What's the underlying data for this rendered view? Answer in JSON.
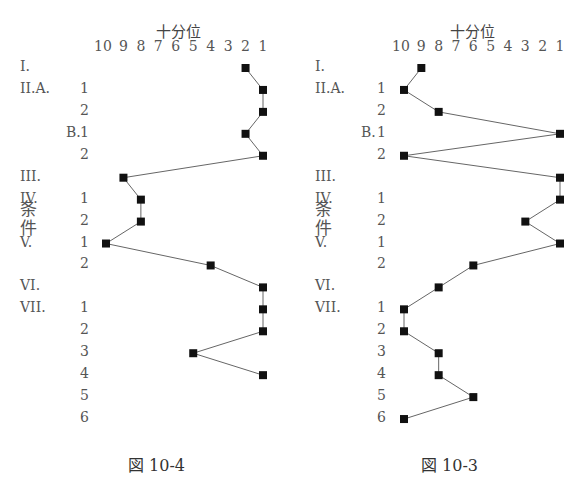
{
  "chart_data": [
    {
      "type": "line",
      "title": "十分位",
      "caption": "図 10-4",
      "xlabel": "十分位",
      "ylabel": "条件",
      "x_ticks": [
        "10",
        "9",
        "8",
        "7",
        "6",
        "5",
        "4",
        "3",
        "2",
        "1"
      ],
      "xlim": [
        10,
        1
      ],
      "orientation": "horizontal-values, vertical-categories",
      "categories": [
        "I.",
        "II.A.1",
        "II.A.2",
        "II.B.1",
        "II.B.2",
        "III.",
        "IV.1",
        "IV.2",
        "V.1",
        "V.2",
        "VI.",
        "VII.1",
        "VII.2",
        "VII.3",
        "VII.4",
        "VII.5",
        "VII.6"
      ],
      "values": [
        2,
        1,
        1,
        2,
        1,
        9,
        8,
        8,
        10,
        4,
        1,
        1,
        1,
        5,
        1,
        null,
        null
      ],
      "marker": "square",
      "grid": false
    },
    {
      "type": "line",
      "title": "十分位",
      "caption": "図 10-3",
      "xlabel": "十分位",
      "ylabel": "条件",
      "x_ticks": [
        "10",
        "9",
        "8",
        "7",
        "6",
        "5",
        "4",
        "3",
        "2",
        "1"
      ],
      "xlim": [
        10,
        1
      ],
      "orientation": "horizontal-values, vertical-categories",
      "categories": [
        "I.",
        "II.A.1",
        "II.A.2",
        "II.B.1",
        "II.B.2",
        "III.",
        "IV.1",
        "IV.2",
        "V.1",
        "V.2",
        "VI.",
        "VII.1",
        "VII.2",
        "VII.3",
        "VII.4",
        "VII.5",
        "VII.6"
      ],
      "values": [
        9,
        10,
        8,
        1,
        10,
        1,
        1,
        3,
        1,
        6,
        8,
        10,
        10,
        8,
        8,
        6,
        10
      ],
      "marker": "square",
      "grid": false
    }
  ],
  "labels": {
    "axis_title": "十分位",
    "y_axis_title_chars": [
      "条",
      "件"
    ],
    "ticks": [
      "10",
      "9",
      "8",
      "7",
      "6",
      "5",
      "4",
      "3",
      "2",
      "1"
    ],
    "rows": [
      {
        "major": "I.",
        "minor": ""
      },
      {
        "major": "II.A.",
        "minor": "1"
      },
      {
        "major": "",
        "minor": "2"
      },
      {
        "major": "B.",
        "minor": "1"
      },
      {
        "major": "",
        "minor": "2"
      },
      {
        "major": "III.",
        "minor": ""
      },
      {
        "major": "IV.",
        "minor": "1"
      },
      {
        "major": "",
        "minor": "2"
      },
      {
        "major": "V.",
        "minor": "1"
      },
      {
        "major": "",
        "minor": "2"
      },
      {
        "major": "VI.",
        "minor": ""
      },
      {
        "major": "VII.",
        "minor": "1"
      },
      {
        "major": "",
        "minor": "2"
      },
      {
        "major": "",
        "minor": "3"
      },
      {
        "major": "",
        "minor": "4"
      },
      {
        "major": "",
        "minor": "5"
      },
      {
        "major": "",
        "minor": "6"
      }
    ],
    "left_caption": "図 10-4",
    "right_caption": "図 10-3"
  }
}
